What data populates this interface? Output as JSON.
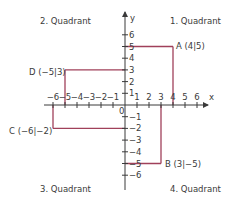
{
  "quadrants": {
    "q1": "1. Quadrant",
    "q2": "2. Quadrant",
    "q3": "3. Quadrant",
    "q4": "4. Quadrant"
  },
  "axes": {
    "x_label": "x",
    "y_label": "y",
    "origin_label": "0",
    "x_ticks": [
      "-6",
      "-5",
      "-4",
      "-3",
      "-2",
      "-1",
      "1",
      "2",
      "3",
      "4",
      "5",
      "6"
    ],
    "y_ticks": [
      "6",
      "5",
      "4",
      "3",
      "2",
      "1",
      "-1",
      "-2",
      "-3",
      "-4",
      "-5",
      "-6"
    ]
  },
  "points": [
    {
      "name": "A",
      "label": "A (4|5)",
      "x": 4,
      "y": 5
    },
    {
      "name": "B",
      "label": "B (3|−5)",
      "x": 3,
      "y": -5
    },
    {
      "name": "C",
      "label": "C (−6|−2)",
      "x": -6,
      "y": -2
    },
    {
      "name": "D",
      "label": "D (−5|3)",
      "x": -5,
      "y": 3
    }
  ],
  "colors": {
    "axis": "#3a3a3a",
    "guide_line": "#a0405a",
    "text": "#3a3a3a"
  }
}
